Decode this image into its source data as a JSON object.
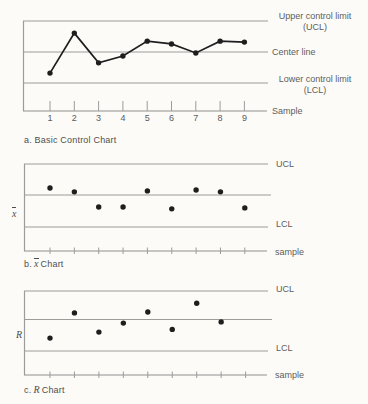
{
  "colors": {
    "background": "#fcfbf8",
    "grid_lines": "#9c9c9c",
    "data": "#1e1e1e",
    "text": "#5d5d5d"
  },
  "chart_data": [
    {
      "type": "line",
      "title": "a. Basic Control Chart",
      "caption_prefix": "a.",
      "caption_symbol": "",
      "caption_suffix": "Basic Control Chart",
      "ylabel_symbol": "",
      "xlabel": "Sample",
      "annotations": {
        "ucl_line1": "Upper control limit",
        "ucl_line2": "(UCL)",
        "center_line": "Center line",
        "lcl_line1": "Lower control limit",
        "lcl_line2": "(LCL)"
      },
      "control_lines": {
        "ucl": 1,
        "center": 0,
        "lcl": -1
      },
      "connected": true,
      "num_ticks": 9,
      "x_tick_labels": [
        "1",
        "2",
        "3",
        "4",
        "5",
        "6",
        "7",
        "8",
        "9"
      ],
      "samples": [
        1,
        2,
        3,
        4,
        5,
        6,
        7,
        8,
        9
      ],
      "values_unit": "relative to control limits: UCL = +1, center line = 0, LCL = -1",
      "values": [
        -0.68,
        0.61,
        -0.35,
        -0.13,
        0.35,
        0.26,
        -0.03,
        0.35,
        0.32
      ]
    },
    {
      "type": "scatter",
      "title": "b. x̄ Chart",
      "caption_prefix": "b.",
      "caption_symbol": "x",
      "caption_symbol_style": "overbar",
      "caption_suffix": "Chart",
      "ylabel_symbol": "x",
      "xlabel": "sample",
      "annotations": {
        "ucl": "UCL",
        "lcl": "LCL"
      },
      "control_lines": {
        "ucl": 1,
        "center": 0,
        "lcl": -1
      },
      "connected": false,
      "num_ticks": 9,
      "x_tick_labels": [],
      "samples": [
        1,
        2,
        3,
        4,
        5,
        6,
        7,
        8,
        9
      ],
      "values_unit": "relative to control limits: UCL = +1, center line = 0, LCL = -1",
      "values": [
        0.22,
        0.1,
        -0.38,
        -0.38,
        0.13,
        -0.44,
        0.16,
        0.1,
        -0.41
      ]
    },
    {
      "type": "scatter",
      "title": "c. R Chart",
      "caption_prefix": "c.",
      "caption_symbol": "R",
      "caption_symbol_style": "italic",
      "caption_suffix": "Chart",
      "ylabel_symbol": "R",
      "xlabel": "sample",
      "annotations": {
        "ucl": "UCL",
        "lcl": "LCL"
      },
      "control_lines": {
        "ucl": 1,
        "center": 0,
        "lcl": -1
      },
      "connected": false,
      "num_ticks": 9,
      "x_tick_labels": [],
      "samples": [
        1,
        2,
        3,
        4,
        5,
        6,
        7,
        8
      ],
      "values_unit": "relative to control limits: UCL = +1, center line = 0, LCL = -1",
      "values": [
        -0.62,
        0.22,
        -0.42,
        -0.12,
        0.25,
        -0.33,
        0.54,
        -0.08
      ]
    }
  ]
}
